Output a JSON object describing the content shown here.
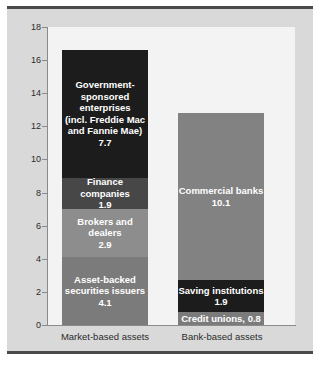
{
  "chart_data": {
    "type": "bar",
    "subtype": "stacked-bar",
    "title": "",
    "subtitle": "",
    "xlabel": "",
    "ylabel": "",
    "ylim": [
      0,
      18
    ],
    "ytick_step": 2,
    "yticks": [
      "18",
      "16",
      "14",
      "12",
      "10",
      "8",
      "6",
      "4",
      "2",
      "0"
    ],
    "grid": false,
    "legend": "none (in-bar labels)",
    "categories": [
      "Market-based assets",
      "Bank-based assets"
    ],
    "series": [
      {
        "category": "Market-based assets",
        "total": 16.6,
        "segments": [
          {
            "name": "Government-sponsored enterprises (incl. Freddie Mac and Fannie Mae)",
            "label": "Government-\nsponsored\nenterprises\n(incl. Freddie Mac\nand  Fannie Mae)",
            "value": 7.7,
            "value_text": "7.7",
            "color": "#1c1c1c"
          },
          {
            "name": "Finance companies",
            "label": "Finance companies",
            "value": 1.9,
            "value_text": "1.9",
            "color": "#474747"
          },
          {
            "name": "Brokers and dealers",
            "label": "Brokers and\ndealers",
            "value": 2.9,
            "value_text": "2.9",
            "color": "#8d8d8d"
          },
          {
            "name": "Asset-backed securities issuers",
            "label": "Asset-backed\nsecurities issuers",
            "value": 4.1,
            "value_text": "4.1",
            "color": "#7b7b7b"
          }
        ]
      },
      {
        "category": "Bank-based assets",
        "total": 12.8,
        "segments": [
          {
            "name": "Commercial banks",
            "label": "Commercial banks",
            "value": 10.1,
            "value_text": "10.1",
            "color": "#828282"
          },
          {
            "name": "Saving institutions",
            "label": "Saving institutions",
            "value": 1.9,
            "value_text": "1.9",
            "color": "#1c1c1c"
          },
          {
            "name": "Credit unions",
            "label": "Credit unions, 0.8",
            "value": 0.8,
            "value_text": "",
            "color": "#7b7b7b"
          }
        ]
      }
    ]
  },
  "axis": {
    "y_labels": [
      "18",
      "16",
      "14",
      "12",
      "10",
      "8",
      "6",
      "4",
      "2",
      "0"
    ]
  },
  "x_labels": {
    "market": "Market-based assets",
    "bank": "Bank-based assets"
  },
  "colors": {
    "frame_background": "#d9d9d9",
    "plot_background": "#f3f3f3",
    "frame_border": "#4a4a4a",
    "axis_line": "#8a8a8a",
    "text": "#2b2b2b",
    "segment_text": "#ffffff"
  }
}
